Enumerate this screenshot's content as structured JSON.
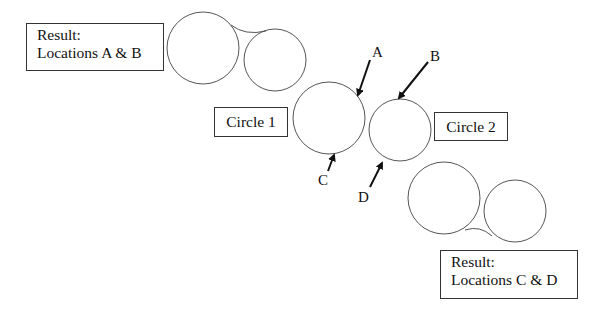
{
  "diagram": {
    "result_top": {
      "line1": "Result:",
      "line2": "Locations A & B"
    },
    "result_bottom": {
      "line1": "Result:",
      "line2": "Locations C & D"
    },
    "circle1_label": "Circle 1",
    "circle2_label": "Circle 2",
    "points": {
      "A": "A",
      "B": "B",
      "C": "C",
      "D": "D"
    },
    "colors": {
      "stroke": "#555555",
      "arrow": "#111111",
      "background": "#ffffff"
    }
  }
}
